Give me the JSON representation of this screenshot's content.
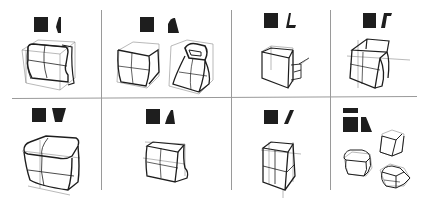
{
  "figure": {
    "layout": {
      "rows": 2,
      "columns": 4
    },
    "colors": {
      "ink": "#1e1e1e",
      "construction": "#8a8a8a",
      "divider": "#9a9a9a",
      "background": "#ffffff"
    },
    "cells": [
      {
        "id": "r1c1",
        "front_glyph": "square",
        "profile_glyph": "bulged-side",
        "sketch": "box with bulging side profile, wrapped band"
      },
      {
        "id": "r1c2",
        "front_glyph": "square",
        "profile_glyph": "curved-wedge",
        "sketch": "rounded box and tapered hooded form"
      },
      {
        "id": "r1c3",
        "front_glyph": "square",
        "profile_glyph": "L-shape",
        "sketch": "L-profile box with stepped base"
      },
      {
        "id": "r1c4",
        "front_glyph": "square",
        "profile_glyph": "Gamma-shape",
        "sketch": "box with overhanging top"
      },
      {
        "id": "r2c1",
        "front_glyph": "square",
        "profile_glyph": "inverted-trapezoid",
        "sketch": "large rounded box tapering downward"
      },
      {
        "id": "r2c2",
        "front_glyph": "square",
        "profile_glyph": "wedge",
        "sketch": "box with flared lower back"
      },
      {
        "id": "r2c3",
        "front_glyph": "square",
        "profile_glyph": "parallelogram",
        "sketch": "slanted box with horizontal split"
      },
      {
        "id": "r2c4",
        "front_glyph": "bar-over-square",
        "profile_glyph": "trapezoid",
        "sketch": "three small box variants"
      }
    ]
  }
}
